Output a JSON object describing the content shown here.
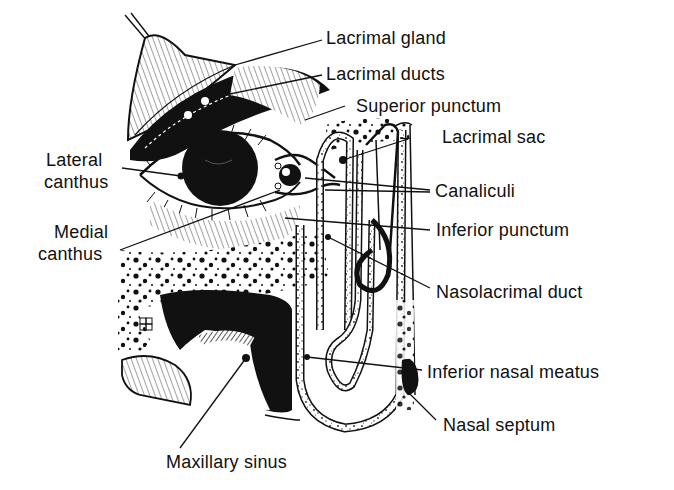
{
  "diagram": {
    "labels": {
      "lacrimal_gland": "Lacrimal gland",
      "lacrimal_ducts": "Lacrimal ducts",
      "superior_punctum": "Superior punctum",
      "lacrimal_sac": "Lacrimal sac",
      "lateral_canthus_1": "Lateral",
      "lateral_canthus_2": "canthus",
      "canaliculi": "Canaliculi",
      "medial_canthus_1": "Medial",
      "medial_canthus_2": "canthus",
      "inferior_punctum": "Inferior punctum",
      "nasolacrimal_duct": "Nasolacrimal duct",
      "inferior_nasal_meatus": "Inferior nasal meatus",
      "nasal_septum": "Nasal septum",
      "maxillary_sinus": "Maxillary sinus"
    },
    "colors": {
      "ink": "#111111",
      "background": "#ffffff"
    }
  }
}
